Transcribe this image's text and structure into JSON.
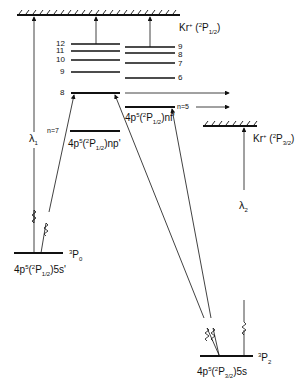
{
  "diagram": {
    "type": "energy-level diagram",
    "ion_limits": [
      {
        "id": "kr_p12",
        "label_prefix": "Kr",
        "charge": "+",
        "term_sup": "2",
        "term": "P",
        "term_sub": "1/2"
      },
      {
        "id": "kr_p32",
        "label_prefix": "Kr",
        "charge": "+",
        "term_sup": "2",
        "term": "P",
        "term_sub": "3/2"
      }
    ],
    "np_series": {
      "label": "4p5(2P1/2)np'",
      "levels": [
        "12",
        "11",
        "10",
        "9",
        "8"
      ],
      "lowest_label": "n=7"
    },
    "nf_series": {
      "label": "4p5(2P1/2)nf'",
      "levels": [
        "9",
        "8",
        "7",
        "6"
      ],
      "lowest_label": "n=5"
    },
    "lower_levels": [
      {
        "config": "4p5(2P1/2)5s'",
        "term": "3P0"
      },
      {
        "config": "4p5(2P3/2)5s",
        "term": "3P2"
      }
    ],
    "wavelengths": [
      "λ1",
      "λ2"
    ]
  },
  "labels": {
    "kr1": {
      "a": "Kr",
      "b": "+",
      "c": " (",
      "d": "2",
      "e": "P",
      "f": "1/2",
      "g": ")"
    },
    "kr2": {
      "a": "Kr",
      "b": "+",
      "c": " (",
      "d": "2",
      "e": "P",
      "f": "3/2",
      "g": ")"
    },
    "np_levels": [
      "12",
      "11",
      "10",
      "9",
      "8"
    ],
    "nf_levels": [
      "9",
      "8",
      "7",
      "6"
    ],
    "n7": "n=7",
    "n5": "n=5",
    "np_label": {
      "a": "4p",
      "b": "5",
      "c": "(",
      "d": "2",
      "e": "P",
      "f": "1/2",
      "g": ")np'"
    },
    "nf_label": {
      "a": "4p",
      "b": "5",
      "c": "(",
      "d": "2",
      "e": "P",
      "f": "1/2",
      "g": ")nf'"
    },
    "p0_config": {
      "a": "4p",
      "b": "5",
      "c": "(",
      "d": "2",
      "e": "P",
      "f": "1/2",
      "g": ")5s'"
    },
    "p0_term": {
      "a": "3",
      "b": "P",
      "c": "0"
    },
    "p2_config": {
      "a": "4p",
      "b": "5",
      "c": "(",
      "d": "2",
      "e": "P",
      "f": "3/2",
      "g": ")5s"
    },
    "p2_term": {
      "a": "3",
      "b": "P",
      "c": "2"
    },
    "lambda1": {
      "a": "λ",
      "b": "1"
    },
    "lambda2": {
      "a": "λ",
      "b": "2"
    }
  }
}
